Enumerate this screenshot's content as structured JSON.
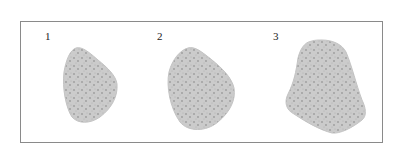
{
  "figure": {
    "panels": [
      {
        "label": "1"
      },
      {
        "label": "2"
      },
      {
        "label": "3"
      }
    ],
    "colors": {
      "border": "#8a8a8a",
      "shape_fill": "#c9c9c9",
      "texture_dark": "#9a9a9a"
    }
  }
}
